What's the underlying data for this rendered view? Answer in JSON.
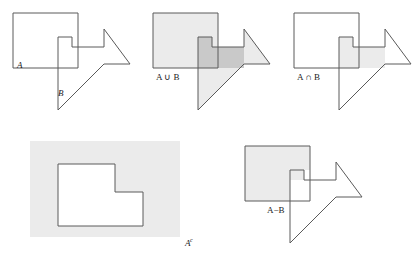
{
  "figure": {
    "background_color": "#ffffff",
    "stroke_color": "#5a5a5a",
    "stroke_width": 1,
    "fill_light": "#ebebeb",
    "fill_dark": "#c9c9c9",
    "fill_none": "#ffffff"
  },
  "panels": [
    {
      "id": "panel-a-b",
      "name": "sets-a-and-b",
      "labels": {
        "set_a": "A",
        "set_b": "B"
      },
      "shaded": "none",
      "description": "Square A and arrow polygon B outlined, no fill"
    },
    {
      "id": "panel-union",
      "name": "a-union-b",
      "labels": {
        "operation": "A ∪ B"
      },
      "shaded": "both",
      "description": "Both A and B shaded; intersection shaded darker"
    },
    {
      "id": "panel-intersection",
      "name": "a-intersect-b",
      "labels": {
        "operation": "A ∩ B"
      },
      "shaded": "intersection",
      "description": "Only overlapping region of A and B shaded"
    },
    {
      "id": "panel-complement",
      "name": "a-complement",
      "labels": {
        "operation": "A",
        "superscript": "c"
      },
      "shaded": "outside-a",
      "description": "Universe rectangle shaded, L-shaped set A left unshaded"
    },
    {
      "id": "panel-difference",
      "name": "a-minus-b",
      "labels": {
        "operation": "A−B"
      },
      "shaded": "a-only",
      "description": "Part of A not in B shaded"
    }
  ],
  "geometry": {
    "square_a": [
      [
        0,
        0
      ],
      [
        72,
        0
      ],
      [
        72,
        56
      ],
      [
        0,
        56
      ]
    ],
    "arrow_b": [
      [
        46,
        24
      ],
      [
        102,
        24
      ],
      [
        126,
        56
      ],
      [
        102,
        88
      ],
      [
        46,
        88
      ]
    ],
    "note": "local panel coordinates, arrow is an L/arrow polygon overlapping square"
  }
}
